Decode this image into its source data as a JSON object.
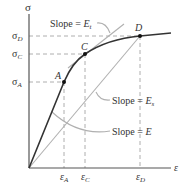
{
  "diagram": {
    "type": "stress-strain curve",
    "axes": {
      "y_label": "σ",
      "x_label": "ε"
    },
    "y_ticks": [
      {
        "id": "D",
        "base": "σ",
        "sub": "D"
      },
      {
        "id": "C",
        "base": "σ",
        "sub": "C"
      },
      {
        "id": "A",
        "base": "σ",
        "sub": "A"
      }
    ],
    "x_ticks": [
      {
        "id": "A",
        "base": "ε",
        "sub": "A"
      },
      {
        "id": "C",
        "base": "ε",
        "sub": "C"
      },
      {
        "id": "D",
        "base": "ε",
        "sub": "D"
      }
    ],
    "points": [
      {
        "label": "A"
      },
      {
        "label": "C"
      },
      {
        "label": "D"
      }
    ],
    "annotations": {
      "tangent": {
        "prefix": "Slope = ",
        "symbol": "E",
        "sub": "t"
      },
      "secant": {
        "prefix": "Slope = ",
        "symbol": "E",
        "sub": "s"
      },
      "elastic": {
        "prefix": "Slope = ",
        "symbol": "E",
        "sub": ""
      }
    },
    "colors": {
      "curve": "#333333",
      "axis": "#555555",
      "construction": "#aaaaaa",
      "dashed": "#888888"
    }
  }
}
